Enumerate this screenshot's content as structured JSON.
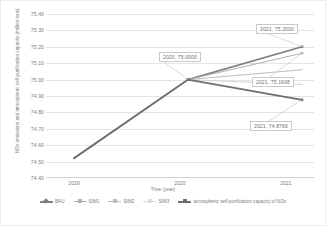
{
  "chart_data": {
    "type": "line",
    "title": "",
    "xlabel": "Time (year)",
    "ylabel": "NOx emissions and atmospheric self-purification capacity (million tons)",
    "x": [
      "2019",
      "2020",
      "2021"
    ],
    "categories": [
      "2019",
      "2020",
      "2021"
    ],
    "ylim": [
      74.4,
      75.4
    ],
    "ytick_labels": [
      "75.40",
      "75.30",
      "75.20",
      "75.10",
      "75.00",
      "74.90",
      "74.80",
      "74.70",
      "74.60",
      "74.50",
      "74.40"
    ],
    "ytick_values": [
      75.4,
      75.3,
      75.2,
      75.1,
      75.0,
      74.9,
      74.8,
      74.7,
      74.6,
      74.5,
      74.4
    ],
    "grid": true,
    "legend_position": "bottom",
    "series": [
      {
        "name": "BAU",
        "color": "#808080",
        "values": [
          74.52,
          75.0,
          75.2
        ]
      },
      {
        "name": "SIM1",
        "color": "#b0b0b0",
        "values": [
          74.52,
          75.0,
          75.1608
        ]
      },
      {
        "name": "SIM2",
        "color": "#bdbdbd",
        "values": [
          74.52,
          75.0,
          75.06
        ]
      },
      {
        "name": "SIM3",
        "color": "#d6d6d6",
        "values": [
          74.52,
          75.0,
          74.97
        ]
      },
      {
        "name": "atmospheric self-purification capacity of NOx",
        "color": "#6e6e6e",
        "values": [
          74.52,
          75.0,
          74.8766
        ]
      }
    ],
    "annotations": [
      {
        "label": "2020, 75.0000",
        "x": "2020",
        "y": 75.0
      },
      {
        "label": "2021, 75.2000",
        "x": "2021",
        "y": 75.2
      },
      {
        "label": "2021, 75.1608",
        "x": "2021",
        "y": 75.1608
      },
      {
        "label": "2021, 74.8766",
        "x": "2021",
        "y": 74.8766
      }
    ]
  },
  "axes": {
    "y_title": "NOx emissions and atmospheric self-purification capacity (million tons)",
    "x_title": "Time (year)",
    "yticks": [
      "75.40",
      "75.30",
      "75.20",
      "75.10",
      "75.00",
      "74.90",
      "74.80",
      "74.70",
      "74.60",
      "74.50",
      "74.40"
    ],
    "xticks": [
      "2019",
      "2020",
      "2021"
    ]
  },
  "legend": {
    "items": [
      {
        "label": "BAU"
      },
      {
        "label": "SIM1"
      },
      {
        "label": "SIM2"
      },
      {
        "label": "SIM3"
      },
      {
        "label": "atmospheric self-purification capacity of NOx"
      }
    ]
  },
  "callouts": [
    {
      "text": "2020, 75.0000"
    },
    {
      "text": "2021, 75.2000"
    },
    {
      "text": "2021, 75.1608"
    },
    {
      "text": "2021, 74.8766"
    }
  ]
}
